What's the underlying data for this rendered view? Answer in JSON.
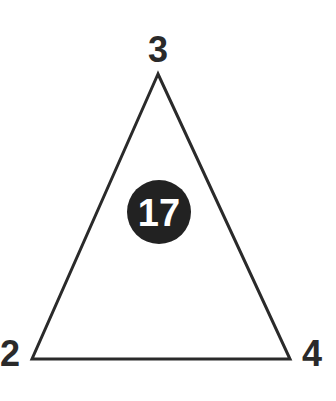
{
  "diagram": {
    "shape": "triangle",
    "vertices": {
      "top": {
        "label": "3"
      },
      "bottom_left": {
        "label": "2"
      },
      "bottom_right": {
        "label": "4"
      }
    },
    "center": {
      "label": "17",
      "style": "white-on-black-circle"
    },
    "colors": {
      "stroke": "#2a2a2a",
      "circle_fill": "#222222",
      "background": "#ffffff"
    }
  }
}
